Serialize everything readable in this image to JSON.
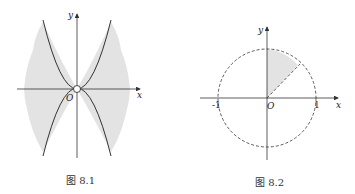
{
  "figures": [
    {
      "id": "fig-8-1",
      "caption": "图 8.1",
      "axis_x_label": "x",
      "axis_y_label": "y",
      "origin_label": "O",
      "description": "Two parabolas tangent at the origin (one opening up, one opening down); shaded region between them on left and right sides; origin marked with open circle"
    },
    {
      "id": "fig-8-2",
      "caption": "图 8.2",
      "axis_x_label": "x",
      "axis_y_label": "y",
      "origin_label": "O",
      "tick_neg_one": "-1",
      "tick_one": "1",
      "description": "Dashed unit circle; shaded sector in first quadrant between a dashed ray at about 50° and the positive y-axis"
    }
  ],
  "colors": {
    "line": "#333333",
    "shade": "#e3e3e3",
    "background": "#ffffff"
  }
}
